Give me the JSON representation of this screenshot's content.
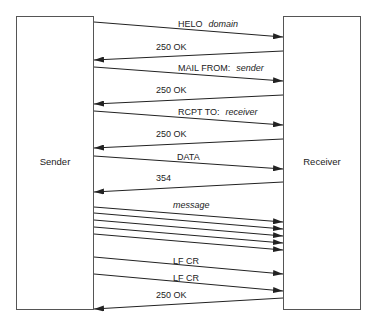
{
  "actors": {
    "sender": {
      "label": "Sender"
    },
    "receiver": {
      "label": "Receiver"
    }
  },
  "messages": [
    {
      "id": "helo",
      "dir": "right",
      "y1": 22,
      "y2": 37,
      "text": "HELO",
      "arg": "domain",
      "lx": 178,
      "ly": 27
    },
    {
      "id": "ok1",
      "dir": "left",
      "y1": 51,
      "y2": 60,
      "text": "250 OK",
      "arg": "",
      "lx": 156,
      "ly": 50
    },
    {
      "id": "mail",
      "dir": "right",
      "y1": 67,
      "y2": 81,
      "text": "MAIL FROM:",
      "arg": "sender",
      "lx": 178,
      "ly": 71
    },
    {
      "id": "ok2",
      "dir": "left",
      "y1": 95,
      "y2": 104,
      "text": "250 OK",
      "arg": "",
      "lx": 156,
      "ly": 93
    },
    {
      "id": "rcpt",
      "dir": "right",
      "y1": 111,
      "y2": 125,
      "text": "RCPT TO:",
      "arg": "receiver",
      "lx": 178,
      "ly": 115
    },
    {
      "id": "ok3",
      "dir": "left",
      "y1": 139,
      "y2": 148,
      "text": "250 OK",
      "arg": "",
      "lx": 156,
      "ly": 137
    },
    {
      "id": "data",
      "dir": "right",
      "y1": 156,
      "y2": 169,
      "text": "DATA",
      "arg": "",
      "lx": 177,
      "ly": 160
    },
    {
      "id": "r354",
      "dir": "left",
      "y1": 182,
      "y2": 192,
      "text": "354",
      "arg": "",
      "lx": 156,
      "ly": 181
    },
    {
      "id": "msg1",
      "dir": "right",
      "y1": 207,
      "y2": 222,
      "text": "",
      "arg": "message",
      "lx": 173,
      "ly": 208
    },
    {
      "id": "msg2",
      "dir": "right",
      "y1": 213,
      "y2": 229,
      "text": "",
      "arg": "",
      "lx": 0,
      "ly": 0
    },
    {
      "id": "msg3",
      "dir": "right",
      "y1": 220,
      "y2": 236,
      "text": "",
      "arg": "",
      "lx": 0,
      "ly": 0
    },
    {
      "id": "msg4",
      "dir": "right",
      "y1": 227,
      "y2": 243,
      "text": "",
      "arg": "",
      "lx": 0,
      "ly": 0
    },
    {
      "id": "msg5",
      "dir": "right",
      "y1": 234,
      "y2": 250,
      "text": "",
      "arg": "",
      "lx": 0,
      "ly": 0
    },
    {
      "id": "lfcr1",
      "dir": "right",
      "y1": 257,
      "y2": 274,
      "text": "LF CR",
      "arg": "",
      "lx": 173,
      "ly": 264
    },
    {
      "id": "lfcr2",
      "dir": "right",
      "y1": 274,
      "y2": 291,
      "text": "LF CR",
      "arg": "",
      "lx": 173,
      "ly": 281
    },
    {
      "id": "ok4",
      "dir": "left",
      "y1": 298,
      "y2": 309,
      "text": "250 OK",
      "arg": "",
      "lx": 156,
      "ly": 298
    }
  ],
  "colors": {
    "line": "#222222",
    "box": "#555555"
  }
}
